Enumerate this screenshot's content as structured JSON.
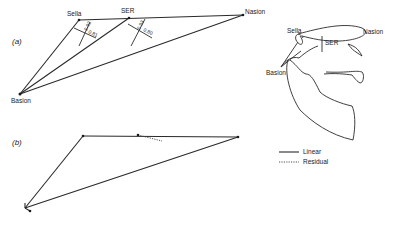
{
  "figure": {
    "panel_a": {
      "label": "(a)",
      "points": {
        "sella": {
          "name": "Sella",
          "x": 79,
          "y": 20
        },
        "ser": {
          "name": "SER",
          "x": 129,
          "y": 18
        },
        "nasion": {
          "name": "Nasion",
          "x": 243,
          "y": 15
        },
        "basion": {
          "name": "Basion",
          "x": 20,
          "y": 94
        }
      },
      "perp_sella": {
        "value_1": "0.92",
        "value_2": "0.81"
      },
      "perp_ser": {
        "value_1": "0.93",
        "value_2": "0.80"
      }
    },
    "panel_b": {
      "label": "(b)"
    },
    "skull": {
      "labels": {
        "sella": "Sella",
        "ser": "SER",
        "nasion": "Nasion",
        "basion": "Basion"
      }
    },
    "legend": {
      "linear": "Linear",
      "residual": "Residual"
    }
  }
}
